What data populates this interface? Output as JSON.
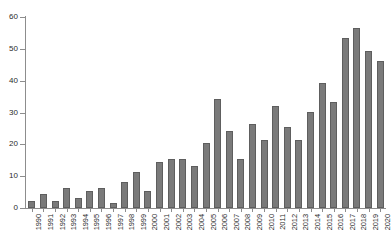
{
  "chart_data": {
    "type": "bar",
    "title": "",
    "xlabel": "",
    "ylabel": "",
    "ylim": [
      0,
      60
    ],
    "yticks": [
      0,
      10,
      20,
      30,
      40,
      50,
      60
    ],
    "grid": false,
    "legend": null,
    "bar_color": "#7a7a7a",
    "bar_edge_color": "#5e5e5e",
    "background": "#ffffff",
    "axis_color": "#8d8d8d",
    "xtick_rotation": 90,
    "categories": [
      "1990",
      "1991",
      "1992",
      "1993",
      "1994",
      "1995",
      "1996",
      "1997",
      "1998",
      "1999",
      "2000",
      "2001",
      "2002",
      "2003",
      "2004",
      "2005",
      "2006",
      "2007",
      "2008",
      "2009",
      "2010",
      "2011",
      "2012",
      "2013",
      "2014",
      "2015",
      "2016",
      "2017",
      "2018",
      "2019",
      "2020"
    ],
    "values": [
      2.3,
      4.4,
      2.3,
      6.4,
      3.3,
      5.4,
      6.4,
      1.5,
      8.2,
      11.3,
      5.4,
      14.3,
      15.3,
      15.3,
      13.3,
      20.4,
      34.2,
      24.3,
      15.3,
      26.3,
      21.3,
      32.2,
      25.3,
      21.3,
      30.3,
      39.2,
      33.2,
      53.4,
      56.4,
      49.3,
      46.3
    ]
  }
}
